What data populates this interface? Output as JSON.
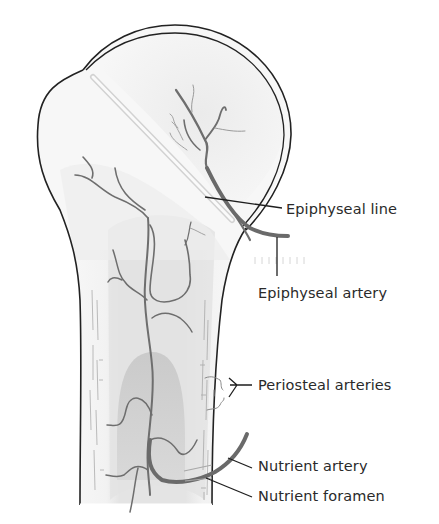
{
  "diagram": {
    "colors": {
      "outline": "#222222",
      "vessel": "#6e6e6e",
      "vessel_dark": "#5a5a5a",
      "marrow_light": "#e6e6e6",
      "marrow_dark": "#c9c9c9",
      "epiphysis_shade": "#dedede",
      "cortex": "#f6f6f6",
      "leader_line": "#1e1e1e"
    },
    "labels": [
      {
        "id": "epiphyseal-line",
        "text": "Epiphyseal line"
      },
      {
        "id": "epiphyseal-artery",
        "text": "Epiphyseal artery"
      },
      {
        "id": "periosteal-arteries",
        "text": "Periosteal arteries"
      },
      {
        "id": "nutrient-artery",
        "text": "Nutrient artery"
      },
      {
        "id": "nutrient-foramen",
        "text": "Nutrient foramen"
      }
    ]
  }
}
